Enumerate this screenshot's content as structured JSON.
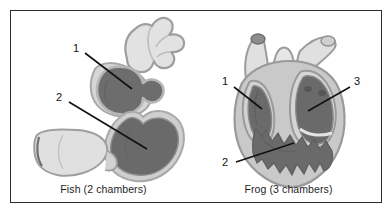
{
  "figure": {
    "border_color": "#2b2b2b",
    "background": "#ffffff"
  },
  "palette": {
    "vessel_fill": "#dedede",
    "vessel_fill_light": "#e8e8e8",
    "vessel_outline": "#9a9a9a",
    "chamber_dark": "#6d6d6d",
    "chamber_dark_alt": "#666666",
    "chamber_outline": "#b4b4b4",
    "body_fill": "#c9c9c9",
    "leader_line": "#111111",
    "label_text": "#111111",
    "caption_text": "#1e1e1e"
  },
  "panels": [
    {
      "id": "fish",
      "caption": "Fish (2 chambers)",
      "organ": "fish-heart",
      "callouts": [
        {
          "number": "1",
          "x": 62,
          "y": 38
        },
        {
          "number": "2",
          "x": 45,
          "y": 87
        }
      ]
    },
    {
      "id": "frog",
      "caption": "Frog (3 chambers)",
      "organ": "frog-heart",
      "callouts": [
        {
          "number": "1",
          "x": 26,
          "y": 70
        },
        {
          "number": "2",
          "x": 28,
          "y": 145
        },
        {
          "number": "3",
          "x": 156,
          "y": 70
        }
      ]
    }
  ]
}
